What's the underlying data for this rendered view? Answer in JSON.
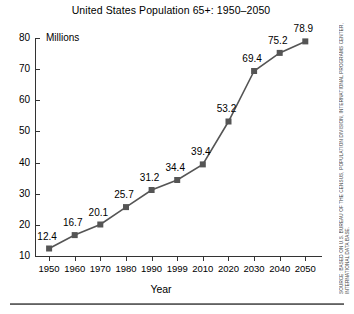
{
  "chart_data": {
    "type": "line",
    "title": "United States Population 65+: 1950–2050",
    "xlabel": "Year",
    "ylabel": "Millions",
    "categories": [
      "1950",
      "1960",
      "1970",
      "1980",
      "1990",
      "1999",
      "2010",
      "2020",
      "2030",
      "2040",
      "2050"
    ],
    "values": [
      12.4,
      16.7,
      20.1,
      25.7,
      31.2,
      34.4,
      39.4,
      53.2,
      69.4,
      75.2,
      78.9
    ],
    "point_labels": [
      "12.4",
      "16.7",
      "20.1",
      "25.7",
      "31.2",
      "34.4",
      "39.4",
      "53.2",
      "69.4",
      "75.2",
      "78.9"
    ],
    "yticks": [
      10,
      20,
      30,
      40,
      50,
      60,
      70,
      80
    ],
    "ytick_labels": [
      "10",
      "20",
      "30",
      "40",
      "50",
      "60",
      "70",
      "80"
    ],
    "ylim": [
      10,
      80
    ],
    "grid": false,
    "legend": false,
    "marker": "square",
    "marker_color": "#555555",
    "line_color": "#555555"
  },
  "source_note": "SOURCE: BASED ON U.S. BUREAU OF THE CENSUS, POPULATION DIVISION, INTERNATIONAL PROGRAMS CENTER, INTERNATIONAL DATA BASE."
}
